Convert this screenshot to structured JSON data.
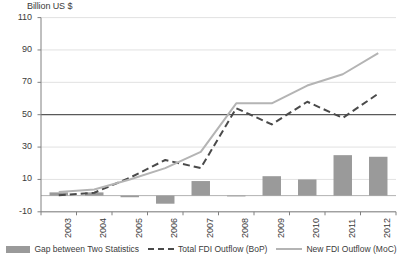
{
  "chart_data": {
    "type": "bar",
    "title": "",
    "ylabel": "Billion US $",
    "xlabel": "",
    "categories": [
      "2003",
      "2004",
      "2005",
      "2006",
      "2007",
      "2008",
      "2009",
      "2010",
      "2011",
      "2012"
    ],
    "ylim": [
      -10,
      110
    ],
    "yticks": [
      -10,
      10,
      30,
      50,
      70,
      90,
      110
    ],
    "grid": true,
    "legend_position": "bottom",
    "series": [
      {
        "name": "Gap between Two Statistics",
        "type": "bar",
        "color": "#9a9a9a",
        "values": [
          2,
          2,
          -1,
          -5,
          9,
          0,
          12,
          10,
          25,
          24
        ]
      },
      {
        "name": "Total FDI Outflow (BoP)",
        "type": "line",
        "style": "dashed",
        "color": "#4a4a4a",
        "values": [
          0.2,
          1.8,
          11,
          22,
          17,
          54,
          44,
          58,
          48,
          63
        ]
      },
      {
        "name": "New FDI Outflow (MoC)",
        "type": "line",
        "style": "solid",
        "color": "#b4b4b4",
        "values": [
          2.2,
          3.8,
          10,
          17,
          27,
          57,
          57,
          68,
          75,
          88
        ]
      }
    ]
  },
  "legend": {
    "items": [
      {
        "label": "Gap between Two Statistics"
      },
      {
        "label": "Total FDI Outflow (BoP)"
      },
      {
        "label": "New FDI Outflow (MoC)"
      }
    ]
  },
  "ytick_labels": [
    "110",
    "90",
    "70",
    "50",
    "30",
    "10",
    "-10"
  ],
  "colors": {
    "bar": "#9a9a9a",
    "dashed_line": "#4a4a4a",
    "solid_line": "#b4b4b4",
    "grid": "#d9d9d9",
    "axis": "#808080",
    "zero_line": "#595959"
  }
}
